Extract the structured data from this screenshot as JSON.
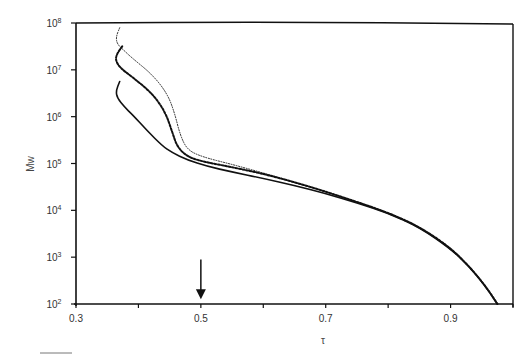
{
  "chart_data": {
    "type": "line",
    "title": "",
    "xlabel": "τ",
    "ylabel": "Mw",
    "xlim": [
      0.3,
      1.0
    ],
    "ylim": [
      100,
      100000000
    ],
    "yscale": "log",
    "grid": false,
    "legend": null,
    "x_ticks": [
      0.3,
      0.4,
      0.5,
      0.6,
      0.7,
      0.8,
      0.9,
      1.0
    ],
    "x_tick_labels": [
      "0.3",
      "",
      "0.5",
      "",
      "0.7",
      "",
      "0.9",
      ""
    ],
    "y_ticks": [
      100,
      1000,
      10000,
      100000,
      1000000,
      10000000,
      100000000
    ],
    "y_tick_labels": [
      {
        "base": "10",
        "exp": "2"
      },
      {
        "base": "10",
        "exp": "3"
      },
      {
        "base": "10",
        "exp": "4"
      },
      {
        "base": "10",
        "exp": "5"
      },
      {
        "base": "10",
        "exp": "6"
      },
      {
        "base": "10",
        "exp": "7"
      },
      {
        "base": "10",
        "exp": "8"
      }
    ],
    "annotations": [
      {
        "type": "arrow",
        "direction": "down",
        "x": 0.5,
        "y_from_log10": 2.95,
        "y_to_log10": 2.1
      }
    ],
    "series": [
      {
        "name": "dotted (fine)",
        "style": "dotted",
        "points_tau_log10Mw": [
          [
            0.37,
            7.9
          ],
          [
            0.364,
            7.7
          ],
          [
            0.366,
            7.55
          ],
          [
            0.378,
            7.4
          ],
          [
            0.39,
            7.25
          ],
          [
            0.422,
            6.9
          ],
          [
            0.446,
            6.5
          ],
          [
            0.458,
            6.08
          ],
          [
            0.467,
            5.6
          ],
          [
            0.478,
            5.3
          ],
          [
            0.5,
            5.15
          ],
          [
            0.55,
            4.98
          ],
          [
            0.6,
            4.8
          ],
          [
            0.65,
            4.6
          ],
          [
            0.7,
            4.4
          ],
          [
            0.75,
            4.18
          ],
          [
            0.8,
            3.95
          ],
          [
            0.85,
            3.65
          ],
          [
            0.9,
            3.2
          ],
          [
            0.93,
            2.8
          ],
          [
            0.955,
            2.4
          ],
          [
            0.975,
            2.0
          ]
        ]
      },
      {
        "name": "dashed (heavy dots)",
        "style": "dashed",
        "points_tau_log10Mw": [
          [
            0.374,
            7.5
          ],
          [
            0.366,
            7.35
          ],
          [
            0.363,
            7.22
          ],
          [
            0.37,
            7.05
          ],
          [
            0.39,
            6.85
          ],
          [
            0.422,
            6.5
          ],
          [
            0.443,
            6.1
          ],
          [
            0.454,
            5.68
          ],
          [
            0.462,
            5.36
          ],
          [
            0.478,
            5.15
          ],
          [
            0.5,
            5.05
          ],
          [
            0.55,
            4.92
          ],
          [
            0.6,
            4.78
          ],
          [
            0.65,
            4.6
          ],
          [
            0.7,
            4.4
          ],
          [
            0.75,
            4.18
          ],
          [
            0.8,
            3.95
          ],
          [
            0.85,
            3.65
          ],
          [
            0.9,
            3.2
          ],
          [
            0.93,
            2.8
          ],
          [
            0.955,
            2.4
          ],
          [
            0.975,
            2.0
          ]
        ]
      },
      {
        "name": "solid",
        "style": "solid",
        "points_tau_log10Mw": [
          [
            0.37,
            6.75
          ],
          [
            0.364,
            6.55
          ],
          [
            0.366,
            6.4
          ],
          [
            0.378,
            6.2
          ],
          [
            0.39,
            6.05
          ],
          [
            0.414,
            5.7
          ],
          [
            0.438,
            5.38
          ],
          [
            0.454,
            5.23
          ],
          [
            0.478,
            5.08
          ],
          [
            0.51,
            4.94
          ],
          [
            0.55,
            4.82
          ],
          [
            0.6,
            4.68
          ],
          [
            0.65,
            4.53
          ],
          [
            0.7,
            4.36
          ],
          [
            0.75,
            4.16
          ],
          [
            0.8,
            3.94
          ],
          [
            0.85,
            3.64
          ],
          [
            0.9,
            3.18
          ],
          [
            0.93,
            2.8
          ],
          [
            0.955,
            2.4
          ],
          [
            0.975,
            2.0
          ]
        ]
      }
    ]
  }
}
